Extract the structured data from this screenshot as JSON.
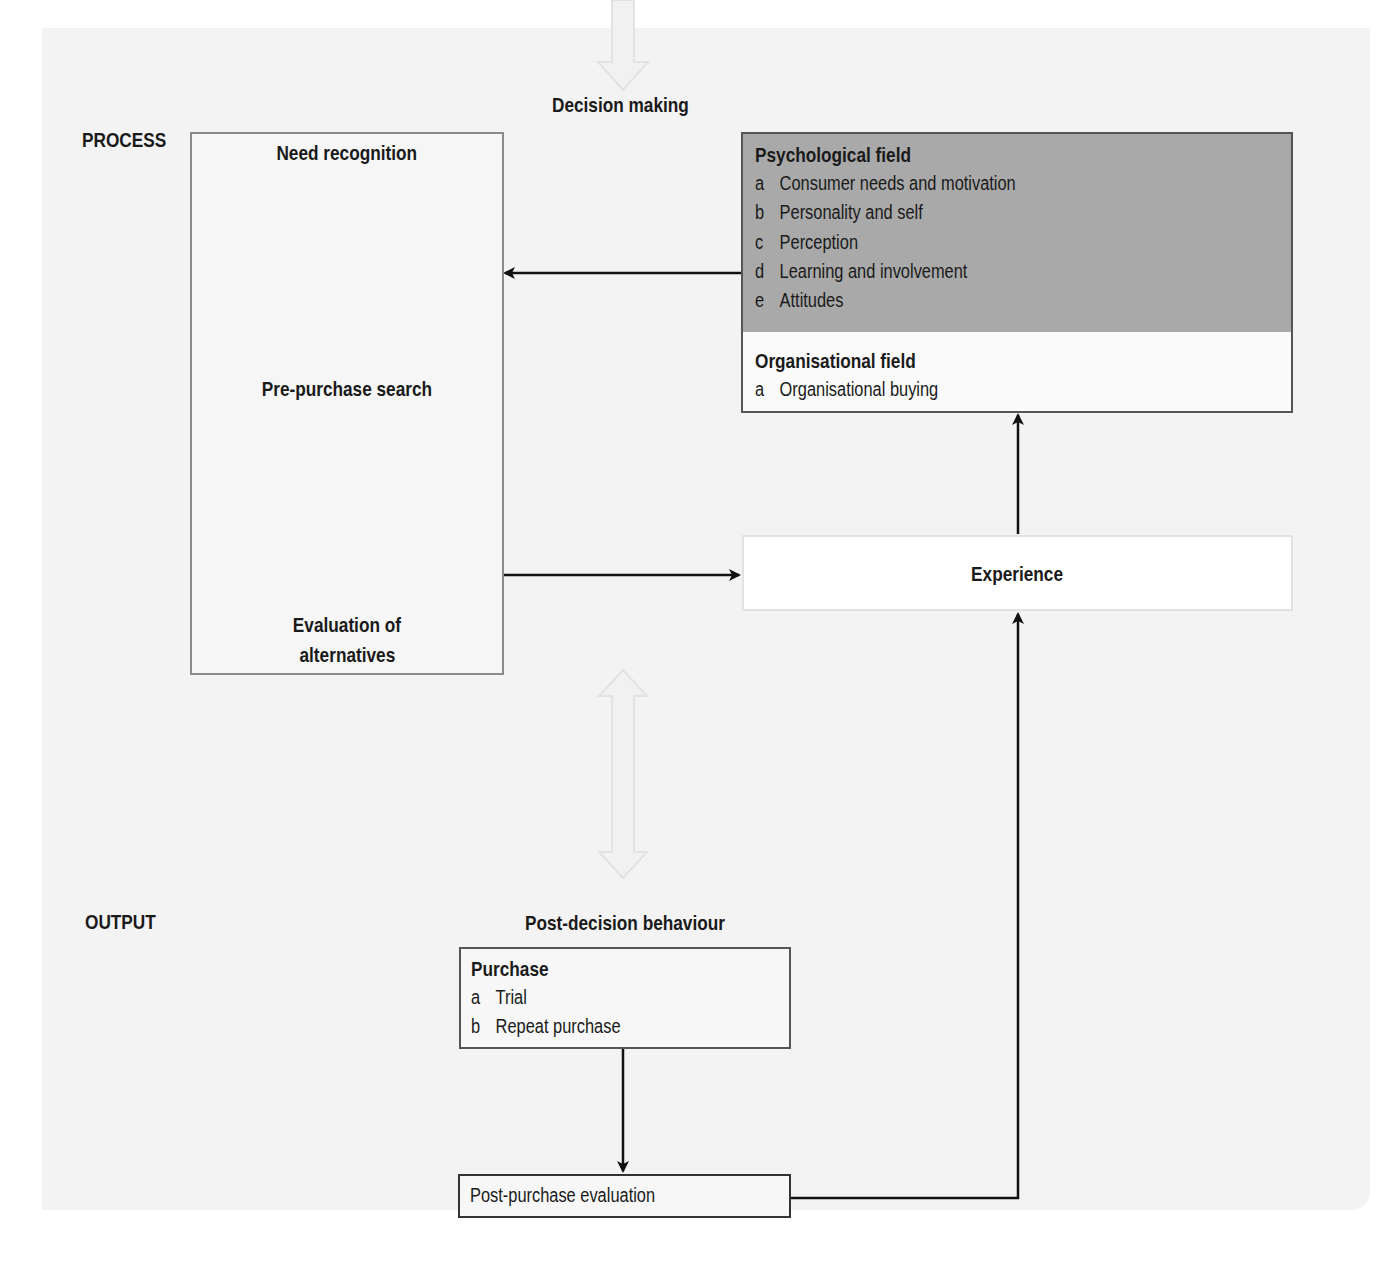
{
  "diagram": {
    "input_arrow_label": "Decision making",
    "sections": {
      "process": "PROCESS",
      "output": "OUTPUT"
    },
    "process_box": {
      "stages": [
        "Need recognition",
        "Pre-purchase search",
        "Evaluation of",
        "alternatives"
      ]
    },
    "psychological_field": {
      "title": "Psychological field",
      "items": [
        {
          "letter": "a",
          "text": "Consumer needs and motivation"
        },
        {
          "letter": "b",
          "text": "Personality and self"
        },
        {
          "letter": "c",
          "text": "Perception"
        },
        {
          "letter": "d",
          "text": "Learning and involvement"
        },
        {
          "letter": "e",
          "text": "Attitudes"
        }
      ],
      "fill_color": "#a9a9a9"
    },
    "organisational_field": {
      "title": "Organisational field",
      "items": [
        {
          "letter": "a",
          "text": "Organisational buying"
        }
      ]
    },
    "experience": {
      "label": "Experience"
    },
    "post_decision": {
      "heading": "Post-decision behaviour",
      "purchase": {
        "title": "Purchase",
        "items": [
          {
            "letter": "a",
            "text": "Trial"
          },
          {
            "letter": "b",
            "text": "Repeat purchase"
          }
        ]
      },
      "evaluation": {
        "label": "Post-purchase evaluation"
      }
    },
    "edges": [
      {
        "from": "Psychological field",
        "to": "Process box",
        "type": "arrow"
      },
      {
        "from": "Process box",
        "to": "Experience",
        "type": "arrow"
      },
      {
        "from": "Experience",
        "to": "Organisational field",
        "type": "arrow"
      },
      {
        "from": "Post-purchase evaluation",
        "to": "Experience",
        "type": "arrow"
      },
      {
        "from": "Purchase",
        "to": "Post-purchase evaluation",
        "type": "arrow"
      },
      {
        "from": "Need recognition",
        "to": "Pre-purchase search",
        "type": "arrow"
      },
      {
        "from": "Pre-purchase search",
        "to": "Evaluation of alternatives",
        "type": "arrow"
      },
      {
        "from": "Decision making (input)",
        "to": "Process",
        "type": "hollow-arrow"
      },
      {
        "from": "Process",
        "to": "Output",
        "type": "hollow-double-arrow"
      }
    ]
  }
}
